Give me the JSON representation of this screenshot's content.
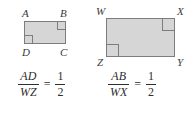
{
  "figure": {
    "fill_color": "#d6d6d6",
    "stroke_color": "#7d7d7d",
    "text_color": "#2e2e2e"
  },
  "shapes": [
    {
      "id": "small-rectangle",
      "name": "rectangle-ABCD",
      "vertices": [
        {
          "key": "a",
          "label": "A",
          "position": "top-left"
        },
        {
          "key": "b",
          "label": "B",
          "position": "top-right"
        },
        {
          "key": "c",
          "label": "C",
          "position": "bottom-right"
        },
        {
          "key": "d",
          "label": "D",
          "position": "bottom-left"
        }
      ],
      "right_angle_marks": [
        "D",
        "B"
      ]
    },
    {
      "id": "large-rectangle",
      "name": "rectangle-WXYZ",
      "vertices": [
        {
          "key": "w",
          "label": "W",
          "position": "top-left"
        },
        {
          "key": "x",
          "label": "X",
          "position": "top-right"
        },
        {
          "key": "y",
          "label": "Y",
          "position": "bottom-right"
        },
        {
          "key": "z",
          "label": "Z",
          "position": "bottom-left"
        }
      ],
      "right_angle_marks": [
        "Z",
        "X"
      ]
    }
  ],
  "equations": [
    {
      "id": "equation-ad-wz",
      "ratio": {
        "numerator": "AD",
        "denominator": "WZ"
      },
      "operator": "=",
      "value": {
        "numerator": "1",
        "denominator": "2"
      }
    },
    {
      "id": "equation-ab-wx",
      "ratio": {
        "numerator": "AB",
        "denominator": "WX"
      },
      "operator": "=",
      "value": {
        "numerator": "1",
        "denominator": "2"
      }
    }
  ]
}
